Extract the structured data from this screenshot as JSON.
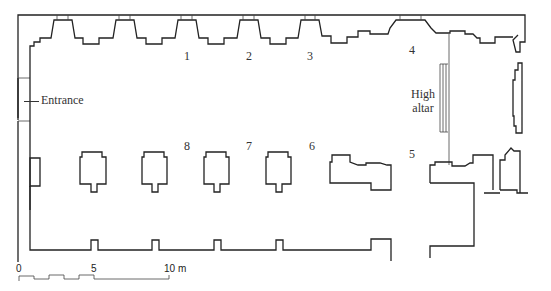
{
  "diagram": {
    "type": "architectural-floor-plan",
    "bays": [
      {
        "id": "1",
        "label": "1"
      },
      {
        "id": "2",
        "label": "2"
      },
      {
        "id": "3",
        "label": "3"
      },
      {
        "id": "4",
        "label": "4"
      },
      {
        "id": "5",
        "label": "5"
      },
      {
        "id": "6",
        "label": "6"
      },
      {
        "id": "7",
        "label": "7"
      },
      {
        "id": "8",
        "label": "8"
      }
    ],
    "entrance_label": "Entrance",
    "altar_label_line1": "High",
    "altar_label_line2": "altar",
    "scale": {
      "tick_0": "0",
      "tick_5": "5",
      "tick_10": "10 m"
    }
  }
}
